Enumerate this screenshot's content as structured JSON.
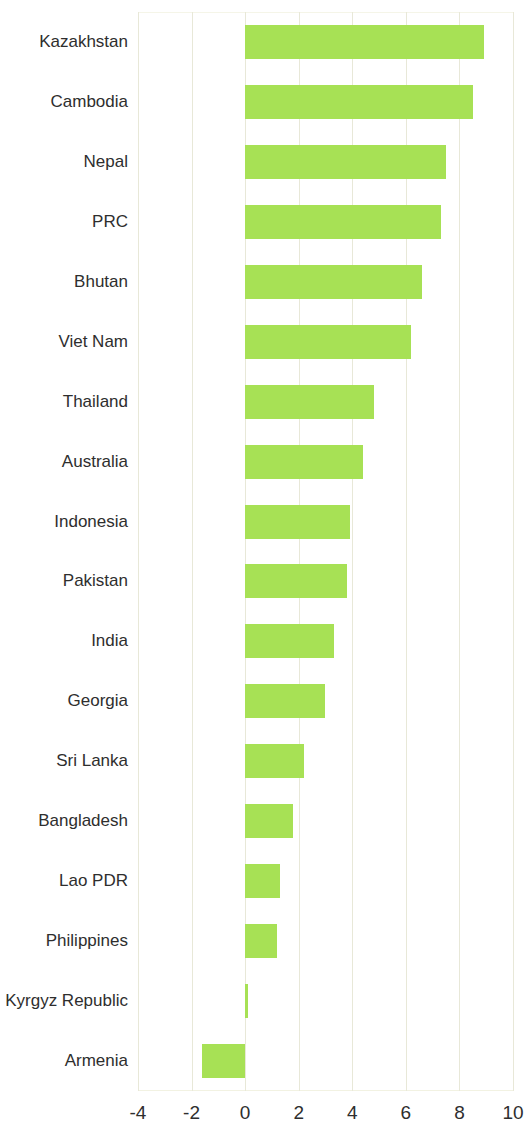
{
  "chart_data": {
    "type": "bar",
    "orientation": "horizontal",
    "title": "",
    "subtitle": "",
    "xlabel": "",
    "ylabel": "",
    "xlim": [
      -4,
      10
    ],
    "ylim": null,
    "grid": true,
    "gridlines": "vertical",
    "legend": null,
    "bar_color": "#a7e155",
    "axis_tick_labels": [
      "-4",
      "-2",
      "0",
      "2",
      "4",
      "6",
      "8",
      "10"
    ],
    "axis_tick_values": [
      -4,
      -2,
      0,
      2,
      4,
      6,
      8,
      10
    ],
    "categories": [
      "Kazakhstan",
      "Cambodia",
      "Nepal",
      "PRC",
      "Bhutan",
      "Viet Nam",
      "Thailand",
      "Australia",
      "Indonesia",
      "Pakistan",
      "India",
      "Georgia",
      "Sri Lanka",
      "Bangladesh",
      "Lao PDR",
      "Philippines",
      "Kyrgyz Republic",
      "Armenia"
    ],
    "values": [
      8.9,
      8.5,
      7.5,
      7.3,
      6.6,
      6.2,
      4.8,
      4.4,
      3.9,
      3.8,
      3.3,
      3.0,
      2.2,
      1.8,
      1.3,
      1.2,
      0.1,
      -1.6
    ]
  }
}
